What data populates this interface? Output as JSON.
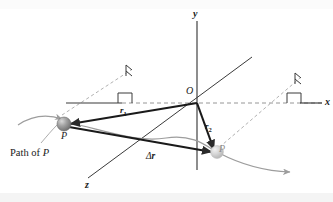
{
  "figure": {
    "kind": "physics-vector-diagram",
    "width": 333,
    "height": 202,
    "background_color": "#ffffff",
    "band_top_color": "#fbfbfb",
    "band_bottom_color": "#f4f4f4"
  },
  "axes": {
    "y_label": "y",
    "x_label": "x",
    "z_label": "z",
    "origin_label": "O",
    "axis_color": "#3a3a3a",
    "dashed_color": "#9a9a9a"
  },
  "points": {
    "p_label": "P",
    "p_prime_label": "P",
    "p_color": "#8c8c8c",
    "p_prime_color": "#c9c9c9"
  },
  "vectors": {
    "r1": {
      "name": "r",
      "subscript": "1"
    },
    "r2": {
      "name": "r",
      "subscript": "2"
    },
    "delta_r": {
      "delta": "Δ",
      "name": "r"
    },
    "vector_color": "#1a1a1a"
  },
  "caption": {
    "path_label_prefix": "Path of ",
    "path_label_point": "P",
    "path_color": "#9d9d9d"
  },
  "markers": {
    "right_angle_label": "right-angle-marker",
    "count": 2
  }
}
